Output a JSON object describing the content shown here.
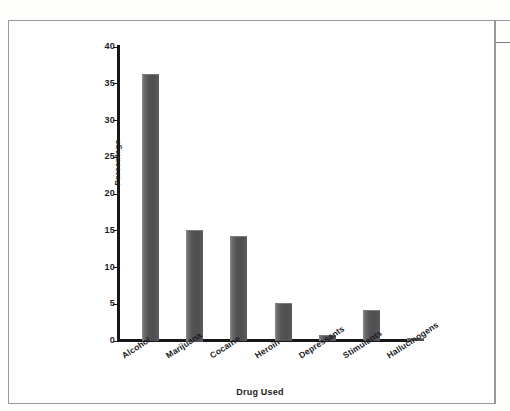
{
  "chart_data": {
    "type": "bar",
    "title": "",
    "subtitle": "",
    "xlabel": "Drug Used",
    "ylabel": "Percentage",
    "categories": [
      "Alcohol",
      "Marijuana",
      "Cocaine",
      "Heroin",
      "Depressants",
      "Stimulants",
      "Hallucinogens"
    ],
    "values": [
      36.2,
      15.0,
      14.2,
      5.1,
      0.7,
      4.2,
      0.4
    ],
    "ylim": [
      0,
      40
    ],
    "yticks": [
      0,
      5,
      10,
      15,
      20,
      25,
      30,
      35,
      40
    ],
    "ytick_labels": [
      "0",
      "5",
      "10",
      "15",
      "20",
      "25",
      "30",
      "35",
      "40"
    ],
    "grid": false,
    "legend": null,
    "legend_position": "none",
    "annotations": [],
    "series": [
      {
        "name": "Percentage",
        "values": [
          36.2,
          15.0,
          14.2,
          5.1,
          0.7,
          4.2,
          0.4
        ]
      }
    ],
    "bar_color": "#545457"
  },
  "figure": {
    "background_color": "#ffffff",
    "border_color": "#9a9a9a",
    "axis_color": "#17171a"
  }
}
